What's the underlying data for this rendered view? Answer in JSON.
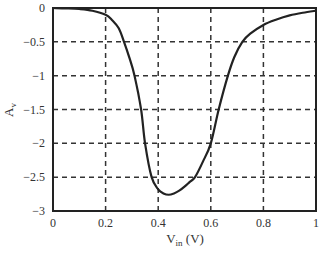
{
  "chart_data": {
    "type": "line",
    "title": "",
    "xlabel": "V_in (V)",
    "xlabel_main": "V",
    "xlabel_sub": "in",
    "xlabel_unit": " (V)",
    "ylabel": "A_v",
    "ylabel_main": "A",
    "ylabel_sub": "v",
    "xlim": [
      0,
      1
    ],
    "ylim": [
      -3,
      0
    ],
    "x_ticks": [
      0,
      0.2,
      0.4,
      0.6,
      0.8,
      1
    ],
    "x_tick_labels": [
      "0",
      "0.2",
      "0.4",
      "0.6",
      "0.8",
      "1"
    ],
    "y_ticks": [
      0,
      -0.5,
      -1,
      -1.5,
      -2,
      -2.5,
      -3
    ],
    "y_tick_labels": [
      "0",
      "−0.5",
      "−1",
      "−1.5",
      "−2",
      "−2.5",
      "−3"
    ],
    "grid": true,
    "grid_style": "dashed",
    "legend": null,
    "series": [
      {
        "name": "Av",
        "color": "#222222",
        "x": [
          0,
          0.05,
          0.1,
          0.15,
          0.2,
          0.225,
          0.25,
          0.27,
          0.29,
          0.31,
          0.335,
          0.35,
          0.375,
          0.4,
          0.42,
          0.44,
          0.46,
          0.48,
          0.5,
          0.52,
          0.54,
          0.57,
          0.6,
          0.63,
          0.665,
          0.69,
          0.72,
          0.75,
          0.8,
          0.85,
          0.9,
          0.95,
          1.0
        ],
        "values": [
          0,
          -0.005,
          -0.015,
          -0.04,
          -0.1,
          -0.18,
          -0.3,
          -0.5,
          -0.73,
          -1.0,
          -1.5,
          -2.0,
          -2.5,
          -2.68,
          -2.74,
          -2.76,
          -2.74,
          -2.7,
          -2.64,
          -2.57,
          -2.5,
          -2.27,
          -2.0,
          -1.5,
          -1.0,
          -0.72,
          -0.5,
          -0.38,
          -0.25,
          -0.17,
          -0.11,
          -0.07,
          -0.04
        ]
      }
    ]
  }
}
